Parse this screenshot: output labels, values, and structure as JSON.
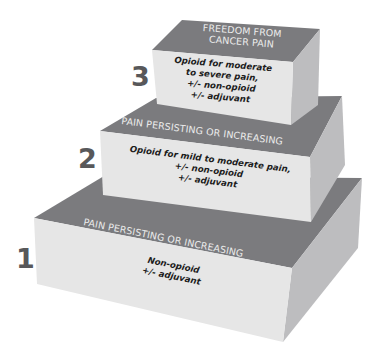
{
  "colors": {
    "top_face": "#7b7b7e",
    "front_face": "#e6e6e6",
    "side_face": "#bdbdbf",
    "step_number": "#58585a",
    "caption_text": "#ececec",
    "body_text": "#1c1c1c"
  },
  "steps": [
    {
      "number": "1",
      "top_caption": [
        "PAIN PERSISTING OR INCREASING"
      ],
      "treatment": [
        "Non-opioid",
        "+/- adjuvant"
      ]
    },
    {
      "number": "2",
      "top_caption": [
        "PAIN PERSISTING OR INCREASING"
      ],
      "treatment": [
        "Opioid for mild to moderate pain,",
        "+/- non-opioid",
        "+/- adjuvant"
      ]
    },
    {
      "number": "3",
      "top_caption": [
        "FREEDOM FROM",
        "CANCER PAIN"
      ],
      "treatment": [
        "Opioid for moderate",
        "to severe pain,",
        "+/- non-opioid",
        "+/- adjuvant"
      ]
    }
  ]
}
